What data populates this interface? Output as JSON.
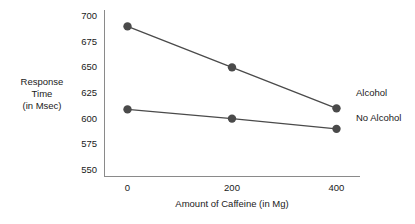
{
  "chart_data": {
    "type": "line",
    "title": "",
    "xlabel": "Amount of Caffeine (in Mg)",
    "ylabel": "Response Time (in Msec)",
    "ylabel_lines": [
      "Response",
      "Time",
      "(in Msec)"
    ],
    "categories": [
      "0",
      "200",
      "400"
    ],
    "x": [
      0,
      200,
      400
    ],
    "xlim": [
      -45,
      445
    ],
    "ylim": [
      543,
      706
    ],
    "yticks": [
      700,
      675,
      650,
      625,
      600,
      575,
      550
    ],
    "ytick_labels": [
      "700",
      "675",
      "650",
      "625",
      "600",
      "575",
      "550"
    ],
    "xtick_labels": [
      "0",
      "200",
      "400"
    ],
    "grid": false,
    "legend_position": "right-inline",
    "series": [
      {
        "name": "Alcohol",
        "values": [
          690,
          650,
          610
        ],
        "color": "#4a4a4a",
        "label_y": 625
      },
      {
        "name": "No Alcohol",
        "values": [
          609,
          600,
          590
        ],
        "color": "#4a4a4a",
        "label_y": 601
      }
    ],
    "axis_color": "#8a8a8a",
    "marker": "circle",
    "marker_size": 4.2
  }
}
